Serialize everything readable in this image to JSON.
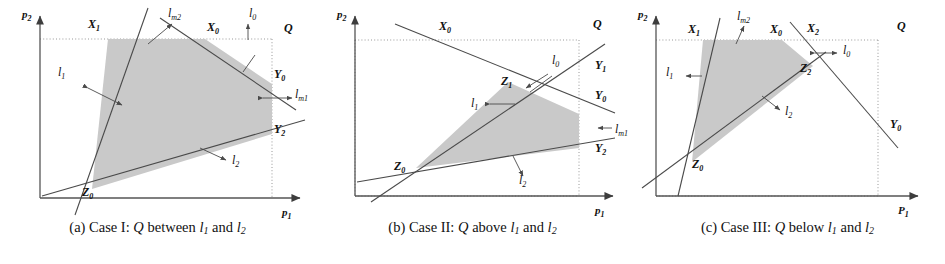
{
  "figure": {
    "colors": {
      "fill": "#c9c9c9",
      "stroke": "#4a4a4a",
      "frame": "#808080",
      "axis": "#555555",
      "text": "#111111"
    }
  },
  "panels": [
    {
      "id": "a",
      "caption": {
        "prefix": "(a)",
        "case": "Case I:",
        "q": "Q",
        "relation": "between",
        "l1": "l",
        "l1sub": "1",
        "and": "and",
        "l2": "l",
        "l2sub": "2",
        "full": "(a) Case I: Q between l1 and l2"
      },
      "axes": {
        "x": "p",
        "xsub": "1",
        "y": "p",
        "ysub": "2"
      },
      "labels": [
        {
          "name": "X1",
          "base": "X",
          "sub": "1",
          "x": 88,
          "y": 28
        },
        {
          "name": "lm2",
          "base": "l",
          "sub": "m2",
          "x": 168,
          "y": 17
        },
        {
          "name": "X0",
          "base": "X",
          "sub": "0",
          "x": 207,
          "y": 31
        },
        {
          "name": "l0",
          "base": "l",
          "sub": "0",
          "x": 249,
          "y": 17
        },
        {
          "name": "Q",
          "base": "Q",
          "sub": "",
          "x": 284,
          "y": 32
        },
        {
          "name": "l1",
          "base": "l",
          "sub": "1",
          "x": 58,
          "y": 76
        },
        {
          "name": "Y0",
          "base": "Y",
          "sub": "0",
          "x": 274,
          "y": 78
        },
        {
          "name": "lm1",
          "base": "l",
          "sub": "m1",
          "x": 295,
          "y": 98
        },
        {
          "name": "Y2",
          "base": "Y",
          "sub": "2",
          "x": 274,
          "y": 133
        },
        {
          "name": "l2",
          "base": "l",
          "sub": "2",
          "x": 232,
          "y": 164
        },
        {
          "name": "Z0",
          "base": "Z",
          "sub": "0",
          "x": 82,
          "y": 196
        }
      ]
    },
    {
      "id": "b",
      "caption": {
        "prefix": "(b)",
        "case": "Case II:",
        "q": "Q",
        "relation": "above",
        "l1": "l",
        "l1sub": "1",
        "and": "and",
        "l2": "l",
        "l2sub": "2",
        "full": "(b) Case II: Q above l1 and l2"
      },
      "axes": {
        "x": "p",
        "xsub": "1",
        "y": "p",
        "ysub": "2"
      },
      "labels": [
        {
          "name": "X0",
          "base": "X",
          "sub": "0",
          "x": 124,
          "y": 30
        },
        {
          "name": "Q",
          "base": "Q",
          "sub": "",
          "x": 278,
          "y": 28
        },
        {
          "name": "l0",
          "base": "l",
          "sub": "0",
          "x": 237,
          "y": 64
        },
        {
          "name": "Y1",
          "base": "Y",
          "sub": "1",
          "x": 280,
          "y": 69
        },
        {
          "name": "Z1",
          "base": "Z",
          "sub": "1",
          "x": 198,
          "y": 85
        },
        {
          "name": "Y0",
          "base": "Y",
          "sub": "0",
          "x": 280,
          "y": 99
        },
        {
          "name": "l1",
          "base": "l",
          "sub": "1",
          "x": 156,
          "y": 107
        },
        {
          "name": "lm1",
          "base": "l",
          "sub": "m1",
          "x": 300,
          "y": 133
        },
        {
          "name": "Y2",
          "base": "Y",
          "sub": "2",
          "x": 280,
          "y": 152
        },
        {
          "name": "Z0",
          "base": "Z",
          "sub": "0",
          "x": 91,
          "y": 170
        },
        {
          "name": "l2",
          "base": "l",
          "sub": "2",
          "x": 204,
          "y": 184
        }
      ]
    },
    {
      "id": "c",
      "caption": {
        "prefix": "(c)",
        "case": "Case III:",
        "q": "Q",
        "relation": "below",
        "l1": "l",
        "l1sub": "1",
        "and": "and",
        "l2": "l",
        "l2sub": "2",
        "full": "(c) Case III: Q below l1 and l2"
      },
      "axes": {
        "x": "P",
        "xsub": "1",
        "y": "p",
        "ysub": "2"
      },
      "labels": [
        {
          "name": "lm2",
          "base": "l",
          "sub": "m2",
          "x": 110,
          "y": 20
        },
        {
          "name": "X1",
          "base": "X",
          "sub": "1",
          "x": 58,
          "y": 33
        },
        {
          "name": "X0",
          "base": "X",
          "sub": "0",
          "x": 140,
          "y": 33
        },
        {
          "name": "X2",
          "base": "X",
          "sub": "2",
          "x": 177,
          "y": 32
        },
        {
          "name": "Q",
          "base": "Q",
          "sub": "",
          "x": 267,
          "y": 30
        },
        {
          "name": "l0",
          "base": "l",
          "sub": "0",
          "x": 213,
          "y": 54
        },
        {
          "name": "Z2",
          "base": "Z",
          "sub": "2",
          "x": 170,
          "y": 72
        },
        {
          "name": "l1",
          "base": "l",
          "sub": "1",
          "x": 40,
          "y": 76
        },
        {
          "name": "l2",
          "base": "l",
          "sub": "2",
          "x": 157,
          "y": 115
        },
        {
          "name": "Y0",
          "base": "Y",
          "sub": "0",
          "x": 260,
          "y": 128
        },
        {
          "name": "Z0",
          "base": "Z",
          "sub": "0",
          "x": 68,
          "y": 163
        }
      ]
    }
  ]
}
